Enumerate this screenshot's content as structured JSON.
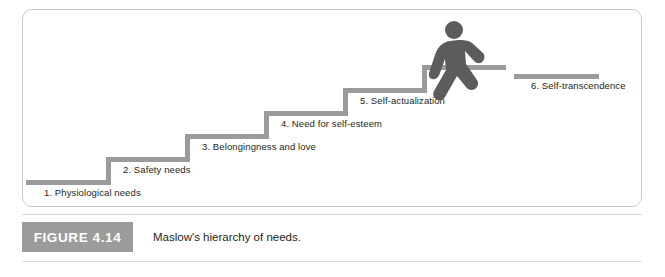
{
  "figure": {
    "tag": "FIGURE 4.14",
    "caption": "Maslow's hierarchy of needs.",
    "accent_color": "#9b9b9b",
    "border_color": "#c9c9c9",
    "text_color": "#231f20"
  },
  "diagram": {
    "type": "staircase",
    "title": "Maslow's hierarchy of needs",
    "walker_icon": "walking-person-icon",
    "steps": [
      {
        "number": "1.",
        "label": "1. Physiological needs"
      },
      {
        "number": "2.",
        "label": "2. Safety needs"
      },
      {
        "number": "3.",
        "label": "3. Belongingness and love"
      },
      {
        "number": "4.",
        "label": "4. Need for self-esteem"
      },
      {
        "number": "5.",
        "label": "5. Self-actualization"
      },
      {
        "number": "6.",
        "label": "6. Self-transcendence"
      }
    ]
  }
}
